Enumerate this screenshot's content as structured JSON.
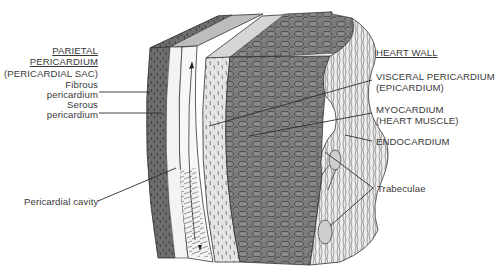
{
  "diagram": {
    "left_group": {
      "heading_line1": "PARIETAL",
      "heading_line2": "PERICARDIUM",
      "subheading": "(PERICARDIAL SAC)",
      "items": [
        {
          "line1": "Fibrous",
          "line2": "pericardium"
        },
        {
          "line1": "Serous",
          "line2": "pericardium"
        }
      ],
      "cavity_label": "Pericardial cavity"
    },
    "right_group": {
      "heading": "HEART WALL",
      "items": [
        {
          "line1": "VISCERAL PERICARDIUM",
          "line2": "(EPICARDIUM)"
        },
        {
          "line1": "MYOCARDIUM",
          "line2": "(HEART MUSCLE)"
        },
        {
          "line1": "ENDOCARDIUM",
          "line2": ""
        }
      ],
      "trabeculae_label": "Trabeculae"
    },
    "colors": {
      "fibrous_layer": "#6b6b6b",
      "serous_layer": "#efefef",
      "myocardium": "#7a7a7a",
      "endocardium": "#e6e6e6",
      "line": "#2e2e2e",
      "text": "#3a3a3a"
    }
  }
}
